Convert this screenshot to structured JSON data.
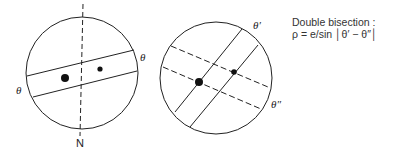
{
  "diagram": {
    "left": {
      "labels": {
        "theta_right": "θ",
        "theta_left": "θ",
        "north": "N"
      }
    },
    "right": {
      "labels": {
        "theta_prime": "θ′",
        "theta_double_prime": "θ″"
      }
    },
    "caption": {
      "title": "Double bisection :",
      "formula": "ρ = e/sin │θ′ − θ″│"
    },
    "colors": {
      "stroke": "#222222",
      "background": "#ffffff"
    }
  }
}
